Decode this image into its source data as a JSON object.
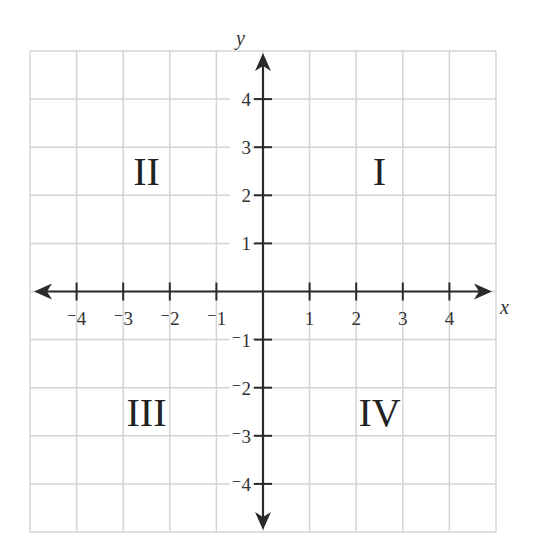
{
  "figure": {
    "type": "coordinate-plane",
    "x_axis": {
      "name": "x",
      "min": -5,
      "max": 5,
      "tick_labels": [
        {
          "v": -4,
          "t": "⁻4"
        },
        {
          "v": -3,
          "t": "⁻3"
        },
        {
          "v": -2,
          "t": "⁻2"
        },
        {
          "v": -1,
          "t": "⁻1"
        },
        {
          "v": 1,
          "t": "1"
        },
        {
          "v": 2,
          "t": "2"
        },
        {
          "v": 3,
          "t": "3"
        },
        {
          "v": 4,
          "t": "4"
        }
      ]
    },
    "y_axis": {
      "name": "y",
      "min": -5,
      "max": 5,
      "tick_labels": [
        {
          "v": 4,
          "t": "4"
        },
        {
          "v": 3,
          "t": "3"
        },
        {
          "v": 2,
          "t": "2"
        },
        {
          "v": 1,
          "t": "1"
        },
        {
          "v": -1,
          "t": "⁻1"
        },
        {
          "v": -2,
          "t": "⁻2"
        },
        {
          "v": -3,
          "t": "⁻3"
        },
        {
          "v": -4,
          "t": "⁻4"
        }
      ]
    },
    "quadrants": [
      {
        "label": "I",
        "x": 2.5,
        "y": 2.5
      },
      {
        "label": "II",
        "x": -2.5,
        "y": 2.5
      },
      {
        "label": "III",
        "x": -2.5,
        "y": -2.5
      },
      {
        "label": "IV",
        "x": 2.5,
        "y": -2.5
      }
    ],
    "grid": true,
    "colors": {
      "grid": "#d4d4d4",
      "axis": "#2a2a2a",
      "text": "#333333"
    }
  }
}
